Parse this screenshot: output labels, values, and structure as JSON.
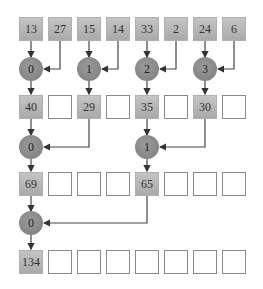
{
  "diagram": {
    "title": "",
    "type": "reduction-tree",
    "colors": {
      "filled_box": "#b5b5b5",
      "empty_box_border": "#8a8a8a",
      "node": "#8a8a8a",
      "arrow": "#333333"
    },
    "rows": [
      {
        "name": "level-0",
        "cells": [
          "13",
          "27",
          "15",
          "14",
          "33",
          "2",
          "24",
          "6"
        ]
      },
      {
        "name": "level-1",
        "cells": [
          "40",
          "",
          "29",
          "",
          "35",
          "",
          "30",
          ""
        ]
      },
      {
        "name": "level-2",
        "cells": [
          "69",
          "",
          "",
          "",
          "65",
          "",
          "",
          ""
        ]
      },
      {
        "name": "level-3",
        "cells": [
          "134",
          "",
          "",
          "",
          "",
          "",
          "",
          ""
        ]
      }
    ],
    "nodes": [
      {
        "level": 1,
        "label": "0",
        "col": 0,
        "from_cols": [
          0,
          1
        ]
      },
      {
        "level": 1,
        "label": "1",
        "col": 2,
        "from_cols": [
          2,
          3
        ]
      },
      {
        "level": 1,
        "label": "2",
        "col": 4,
        "from_cols": [
          4,
          5
        ]
      },
      {
        "level": 1,
        "label": "3",
        "col": 6,
        "from_cols": [
          6,
          7
        ]
      },
      {
        "level": 2,
        "label": "0",
        "col": 0,
        "from_cols": [
          0,
          2
        ]
      },
      {
        "level": 2,
        "label": "1",
        "col": 4,
        "from_cols": [
          4,
          6
        ]
      },
      {
        "level": 3,
        "label": "0",
        "col": 0,
        "from_cols": [
          0,
          4
        ]
      }
    ]
  }
}
